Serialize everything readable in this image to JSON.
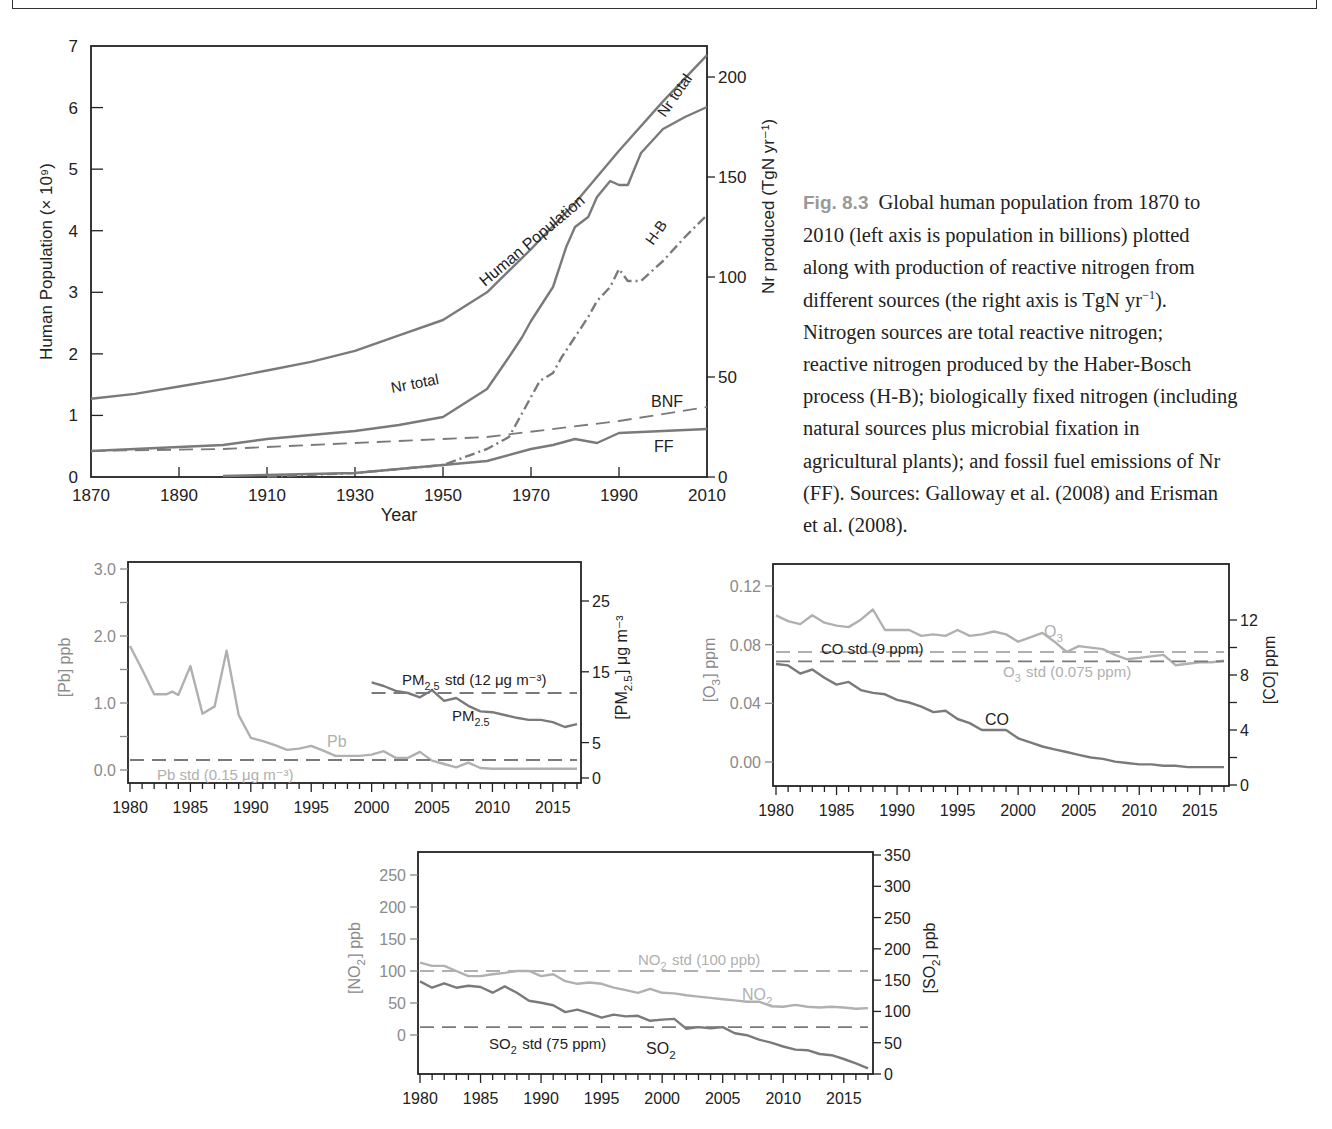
{
  "caption": {
    "fig_label": "Fig. 8.3",
    "text_lines": [
      "Global human population from 1870 to",
      "2010 (left axis is population in billions) plotted",
      "along with production of reactive nitrogen from",
      "different sources (the right axis is TgN yr",
      "Nitrogen sources are total reactive nitrogen;",
      "reactive nitrogen produced by the Haber-Bosch",
      "process (H-B); biologically fixed nitrogen (including",
      "natural sources plus microbial fixation in",
      "agricultural plants); and fossil fuel emissions of Nr",
      "(FF).  Sources: Galloway et al. (2008) and Erisman",
      "et al. (2008)."
    ],
    "line4_sup": "−1",
    "line4_tail": ")."
  },
  "colors": {
    "axis": "#222222",
    "line_dark": "#7a7a7a",
    "line_light": "#b0b0b0",
    "tick_label_gray": "#8a8a8a",
    "caption_label": "#9a9a9a"
  },
  "chart_data": [
    {
      "id": "nitrogen_population",
      "type": "line",
      "title": "",
      "xlabel": "Year",
      "ylabel": "Human Population (× 10⁹)",
      "ylabel_right": "Nr produced (TgN yr⁻¹)",
      "xlim": [
        1870,
        2010
      ],
      "ylim": [
        0,
        7
      ],
      "ylim_right": [
        0,
        215
      ],
      "xticks": [
        1870,
        1890,
        1910,
        1930,
        1950,
        1970,
        1990,
        2010
      ],
      "yticks": [
        0,
        1,
        2,
        3,
        4,
        5,
        6,
        7
      ],
      "yticks_right": [
        0,
        50,
        100,
        150,
        200
      ],
      "grid": false,
      "series": [
        {
          "name": "Human Population",
          "axis": "left",
          "style": "solid",
          "x": [
            1870,
            1880,
            1890,
            1900,
            1910,
            1920,
            1930,
            1940,
            1950,
            1960,
            1970,
            1980,
            1990,
            2000,
            2010
          ],
          "y": [
            1.27,
            1.35,
            1.47,
            1.59,
            1.73,
            1.87,
            2.05,
            2.3,
            2.55,
            3.0,
            3.7,
            4.45,
            5.3,
            6.1,
            6.85
          ]
        },
        {
          "name": "Nr total",
          "axis": "right",
          "style": "solid",
          "x": [
            1870,
            1880,
            1890,
            1900,
            1910,
            1920,
            1930,
            1940,
            1950,
            1955,
            1960,
            1965,
            1968,
            1970,
            1975,
            1978,
            1980,
            1983,
            1985,
            1988,
            1990,
            1992,
            1995,
            2000,
            2005,
            2010
          ],
          "y": [
            13,
            14,
            15,
            16,
            19,
            21,
            23,
            26,
            30,
            37,
            44,
            60,
            70,
            78,
            95,
            115,
            125,
            130,
            140,
            148,
            146,
            146,
            162,
            174,
            180,
            185
          ]
        },
        {
          "name": "H-B",
          "axis": "right",
          "style": "dashdot",
          "x": [
            1910,
            1930,
            1950,
            1955,
            1960,
            1965,
            1970,
            1972,
            1975,
            1977,
            1980,
            1983,
            1985,
            1988,
            1990,
            1992,
            1995,
            1998,
            2000,
            2005,
            2010
          ],
          "y": [
            0.2,
            2,
            6,
            10,
            14,
            20,
            40,
            48,
            52,
            60,
            70,
            80,
            88,
            95,
            104,
            98,
            98,
            104,
            108,
            120,
            131
          ]
        },
        {
          "name": "BNF",
          "axis": "right",
          "style": "dashed",
          "x": [
            1870,
            1900,
            1930,
            1960,
            1990,
            2010
          ],
          "y": [
            13,
            14,
            17,
            20,
            28,
            35
          ]
        },
        {
          "name": "FF",
          "axis": "right",
          "style": "solid",
          "x": [
            1900,
            1930,
            1950,
            1960,
            1970,
            1975,
            1980,
            1985,
            1990,
            2000,
            2010
          ],
          "y": [
            0.5,
            2,
            6,
            8,
            14,
            16,
            19,
            17,
            22,
            23,
            24
          ]
        }
      ],
      "annotations": [
        "Human Population",
        "Nr total",
        "Nr total",
        "H-B",
        "BNF",
        "FF"
      ]
    },
    {
      "id": "pb_pm25",
      "type": "line",
      "xlabel": "",
      "ylabel": "[Pb] ppb",
      "ylabel_right": "[PM2.5] μg m⁻³",
      "xlim": [
        1980,
        2017
      ],
      "ylim": [
        0,
        3.0
      ],
      "ylim_right": [
        0,
        28
      ],
      "xticks": [
        1980,
        1985,
        1990,
        1995,
        2000,
        2005,
        2010,
        2015
      ],
      "yticks_labeled": [
        0.0,
        1.0,
        2.0,
        3.0
      ],
      "yticks_minor": [
        0.5,
        1.5,
        2.5
      ],
      "yticks_right": [
        0,
        5,
        15,
        25
      ],
      "grid": false,
      "series": [
        {
          "name": "Pb",
          "axis": "left",
          "color": "light",
          "x": [
            1980,
            1981,
            1982,
            1983,
            1983.5,
            1984,
            1985,
            1986,
            1987,
            1988,
            1989,
            1990,
            1991,
            1992,
            1993,
            1994,
            1995,
            1996,
            1997,
            1998,
            1999,
            2000,
            2001,
            2002,
            2003,
            2004,
            2005,
            2006,
            2007,
            2008,
            2009,
            2010,
            2017
          ],
          "y": [
            1.85,
            1.5,
            1.13,
            1.13,
            1.17,
            1.12,
            1.55,
            0.84,
            0.95,
            1.78,
            0.82,
            0.48,
            0.43,
            0.37,
            0.3,
            0.32,
            0.36,
            0.29,
            0.21,
            0.21,
            0.21,
            0.23,
            0.28,
            0.18,
            0.18,
            0.27,
            0.14,
            0.09,
            0.04,
            0.11,
            0.03,
            0.02,
            0.02
          ]
        },
        {
          "name": "PM2.5",
          "axis": "right",
          "color": "dark",
          "x": [
            2000,
            2001,
            2002,
            2003,
            2004,
            2005,
            2006,
            2007,
            2008,
            2009,
            2010,
            2011,
            2012,
            2013,
            2014,
            2015,
            2016,
            2017
          ],
          "y": [
            13.5,
            13.0,
            12.3,
            12.0,
            11.4,
            12.4,
            10.9,
            11.3,
            10.2,
            9.4,
            9.3,
            8.9,
            8.5,
            8.2,
            8.2,
            7.9,
            7.2,
            7.6
          ]
        },
        {
          "name": "Pb std (0.15 μg m⁻³)",
          "axis": "left",
          "style": "dashed",
          "color": "dark",
          "x": [
            1980,
            2017
          ],
          "y": [
            0.15,
            0.15
          ]
        },
        {
          "name": "PM2.5 std (12 μg m⁻³)",
          "axis": "right",
          "style": "dashed",
          "color": "dark",
          "x": [
            2000,
            2017
          ],
          "y": [
            12,
            12
          ]
        }
      ],
      "annotations": [
        "Pb",
        "Pb std (0.15 μg m⁻³)",
        "PM2.5 std (12 μg m⁻³)",
        "PM2.5"
      ]
    },
    {
      "id": "o3_co",
      "type": "line",
      "xlabel": "",
      "ylabel": "[O3] ppm",
      "ylabel_right": "[CO] ppm",
      "xlim": [
        1980,
        2017
      ],
      "ylim": [
        -0.016,
        0.135
      ],
      "ylim_right": [
        0,
        15
      ],
      "xticks": [
        1980,
        1985,
        1990,
        1995,
        2000,
        2005,
        2010,
        2015
      ],
      "yticks": [
        0.0,
        0.04,
        0.08,
        0.12
      ],
      "yticks_right": [
        0,
        2,
        4,
        6,
        8,
        10,
        12
      ],
      "yticks_right_labeled": [
        0,
        4,
        8,
        12
      ],
      "grid": false,
      "series": [
        {
          "name": "O3",
          "axis": "left",
          "color": "light",
          "x": [
            1980,
            1981,
            1982,
            1983,
            1984,
            1985,
            1986,
            1987,
            1988,
            1989,
            1990,
            1991,
            1992,
            1993,
            1994,
            1995,
            1996,
            1997,
            1998,
            1999,
            2000,
            2001,
            2002,
            2003,
            2004,
            2005,
            2006,
            2007,
            2008,
            2009,
            2010,
            2011,
            2012,
            2013,
            2014,
            2015,
            2016,
            2017
          ],
          "y": [
            0.1,
            0.096,
            0.094,
            0.1,
            0.095,
            0.093,
            0.092,
            0.097,
            0.104,
            0.09,
            0.09,
            0.09,
            0.086,
            0.087,
            0.086,
            0.09,
            0.086,
            0.087,
            0.089,
            0.087,
            0.082,
            0.085,
            0.088,
            0.082,
            0.075,
            0.079,
            0.078,
            0.077,
            0.073,
            0.07,
            0.071,
            0.072,
            0.073,
            0.066,
            0.067,
            0.068,
            0.068,
            0.069
          ]
        },
        {
          "name": "CO",
          "axis": "right",
          "color": "dark",
          "x": [
            1980,
            1981,
            1982,
            1983,
            1984,
            1985,
            1986,
            1987,
            1988,
            1989,
            1990,
            1991,
            1992,
            1993,
            1994,
            1995,
            1996,
            1997,
            1998,
            1999,
            2000,
            2001,
            2002,
            2003,
            2004,
            2005,
            2006,
            2007,
            2008,
            2009,
            2010,
            2011,
            2012,
            2013,
            2014,
            2015,
            2016,
            2017
          ],
          "y": [
            8.8,
            8.7,
            8.1,
            8.4,
            7.8,
            7.3,
            7.5,
            6.9,
            6.7,
            6.6,
            6.2,
            6.0,
            5.7,
            5.3,
            5.4,
            4.8,
            4.5,
            4.0,
            4.0,
            4.0,
            3.4,
            3.1,
            2.8,
            2.6,
            2.4,
            2.2,
            2.0,
            1.9,
            1.7,
            1.6,
            1.5,
            1.5,
            1.4,
            1.4,
            1.3,
            1.3,
            1.3,
            1.3
          ]
        },
        {
          "name": "CO std (9 ppm)",
          "axis": "right",
          "style": "dashed",
          "color": "dark",
          "x": [
            1980,
            2017
          ],
          "y": [
            9,
            9
          ]
        },
        {
          "name": "O3 std (0.075 ppm)",
          "axis": "left",
          "style": "dashed",
          "color": "light",
          "x": [
            1980,
            2017
          ],
          "y": [
            0.075,
            0.075
          ]
        }
      ],
      "annotations": [
        "O3",
        "CO std (9 ppm)",
        "O3 std (0.075 ppm)",
        "CO"
      ]
    },
    {
      "id": "no2_so2",
      "type": "line",
      "xlabel": "",
      "ylabel": "[NO2] ppb",
      "ylabel_right": "[SO2] ppb",
      "xlim": [
        1980,
        2017
      ],
      "ylim": [
        -60,
        285
      ],
      "ylim_right": [
        0,
        350
      ],
      "xticks": [
        1980,
        1985,
        1990,
        1995,
        2000,
        2005,
        2010,
        2015
      ],
      "yticks": [
        0,
        50,
        100,
        150,
        200,
        250
      ],
      "yticks_right": [
        0,
        50,
        100,
        150,
        200,
        250,
        300,
        350
      ],
      "grid": false,
      "series": [
        {
          "name": "NO2",
          "axis": "left",
          "color": "light",
          "x": [
            1980,
            1981,
            1982,
            1983,
            1984,
            1985,
            1986,
            1987,
            1988,
            1989,
            1990,
            1991,
            1992,
            1993,
            1994,
            1995,
            1996,
            1997,
            1998,
            1999,
            2000,
            2001,
            2002,
            2003,
            2004,
            2005,
            2006,
            2007,
            2008,
            2009,
            2010,
            2011,
            2012,
            2013,
            2014,
            2015,
            2016,
            2017
          ],
          "y": [
            113,
            108,
            108,
            100,
            92,
            92,
            95,
            97,
            100,
            100,
            92,
            95,
            84,
            80,
            82,
            80,
            74,
            70,
            66,
            72,
            66,
            65,
            62,
            60,
            58,
            56,
            54,
            52,
            52,
            45,
            44,
            47,
            44,
            43,
            44,
            43,
            41,
            42
          ]
        },
        {
          "name": "SO2",
          "axis": "right",
          "color": "dark",
          "x": [
            1980,
            1981,
            1982,
            1983,
            1984,
            1985,
            1986,
            1987,
            1988,
            1989,
            1990,
            1991,
            1992,
            1993,
            1994,
            1995,
            1996,
            1997,
            1998,
            1999,
            2000,
            2001,
            2002,
            2003,
            2004,
            2005,
            2006,
            2007,
            2008,
            2009,
            2010,
            2011,
            2012,
            2013,
            2014,
            2015,
            2016,
            2017
          ],
          "y": [
            148,
            138,
            145,
            138,
            141,
            139,
            130,
            140,
            130,
            117,
            114,
            110,
            99,
            103,
            97,
            90,
            95,
            92,
            93,
            85,
            87,
            88,
            72,
            75,
            73,
            75,
            65,
            62,
            55,
            50,
            44,
            39,
            38,
            32,
            30,
            24,
            17,
            9
          ]
        },
        {
          "name": "NO2 std (100 ppb)",
          "axis": "left",
          "style": "dashed",
          "color": "light",
          "x": [
            1980,
            2017
          ],
          "y": [
            100,
            100
          ]
        },
        {
          "name": "SO2 std (75 ppm)",
          "axis": "right",
          "style": "dashed",
          "color": "dark",
          "x": [
            1980,
            2017
          ],
          "y": [
            75,
            75
          ]
        }
      ],
      "annotations": [
        "NO2 std (100 ppb)",
        "NO2",
        "SO2 std (75 ppm)",
        "SO2"
      ]
    }
  ],
  "layout": [
    {
      "chart": 0,
      "frame": [
        91,
        46,
        707,
        477
      ],
      "xmap": [
        1870,
        91,
        2010,
        707
      ],
      "ymap": [
        0,
        477,
        7,
        46
      ],
      "yrmap": [
        0,
        477,
        200,
        77
      ]
    },
    {
      "chart": 1,
      "frame": [
        128,
        562,
        581,
        783
      ],
      "xmap": [
        1980,
        130,
        2017,
        577
      ],
      "ymap": [
        0,
        770,
        3,
        569
      ],
      "yrmap": [
        0,
        778,
        25,
        601
      ]
    },
    {
      "chart": 2,
      "frame": [
        773,
        564,
        1229,
        786
      ],
      "xmap": [
        1980,
        776,
        2017,
        1224
      ],
      "ymap": [
        0,
        762,
        0.12,
        586
      ],
      "yrmap": [
        0,
        785,
        12,
        620
      ]
    },
    {
      "chart": 3,
      "frame": [
        418,
        852,
        873,
        1074
      ],
      "xmap": [
        1980,
        420,
        2017,
        868
      ],
      "ymap": [
        0,
        1035,
        250,
        875
      ],
      "yrmap": [
        0,
        1074,
        350,
        855
      ]
    }
  ]
}
